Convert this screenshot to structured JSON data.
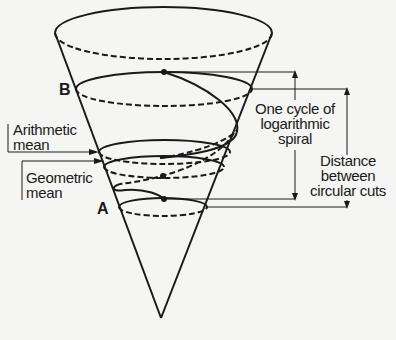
{
  "diagram": {
    "points": {
      "b": "B",
      "a": "A"
    },
    "labels": {
      "arithmetic_line1": "Arithmetic",
      "arithmetic_line2": "mean",
      "geometric_line1": "Geometric",
      "geometric_line2": "mean",
      "cycle_line1": "One cycle of",
      "cycle_line2": "logarithmic",
      "cycle_line3": "spiral",
      "distance_line1": "Distance",
      "distance_line2": "between",
      "distance_line3": "circular cuts"
    },
    "colors": {
      "ink": "#1a1a1a",
      "background": "#f5f5f3"
    }
  }
}
